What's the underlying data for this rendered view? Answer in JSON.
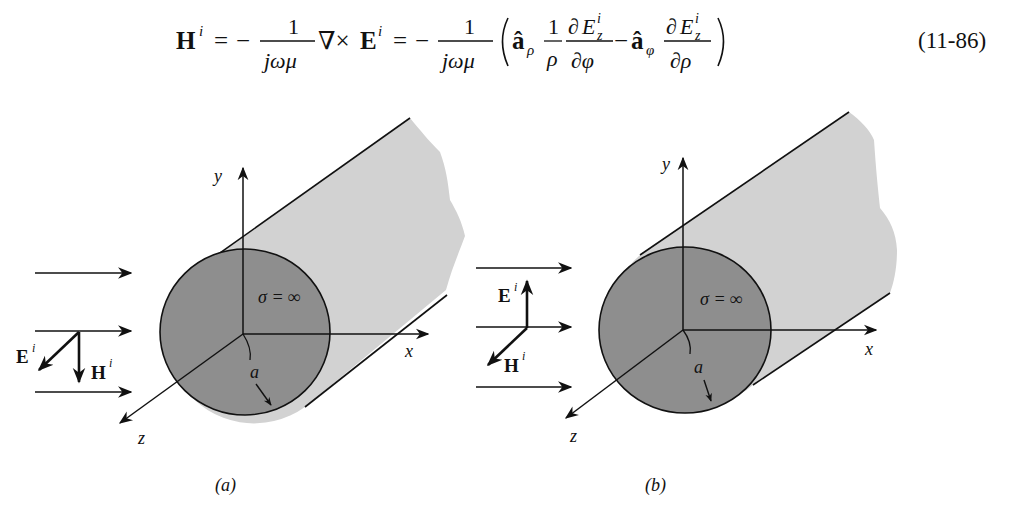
{
  "equation": {
    "lhs": "H",
    "lhs_sup": "i",
    "eq1": "=",
    "minus": "−",
    "num1": "1",
    "den1": "jωμ",
    "curl": "∇×",
    "E": "E",
    "E_sup": "i",
    "eq2": "=",
    "num2": "1",
    "den2": "jωμ",
    "a_hat": "â",
    "sub_rho": "ρ",
    "sub_phi": "φ",
    "one": "1",
    "rho": "ρ",
    "partial": "∂",
    "Ez": "E",
    "Ez_sub": "z",
    "Ez_sup": "i",
    "dphi": "∂φ",
    "drho": "∂ρ",
    "number": "(11-86)"
  },
  "figures": [
    {
      "id": "a",
      "caption": "(a)",
      "axis_labels": {
        "x": "x",
        "y": "y",
        "z": "z"
      },
      "conductivity_label": "σ = ∞",
      "radius_label": "a",
      "E_label": "E",
      "E_sup": "i",
      "H_label": "H",
      "H_sup": "i",
      "E_direction": "along z (toward viewer)",
      "H_direction": "-y (down)"
    },
    {
      "id": "b",
      "caption": "(b)",
      "axis_labels": {
        "x": "x",
        "y": "y",
        "z": "z"
      },
      "conductivity_label": "σ = ∞",
      "radius_label": "a",
      "E_label": "E",
      "E_sup": "i",
      "H_label": "H",
      "H_sup": "i",
      "E_direction": "+y (up)",
      "H_direction": "along z (toward viewer)"
    }
  ],
  "colors": {
    "ink": "#111111",
    "cylinder_body": "#d2d2d2",
    "cylinder_face": "#8e8e8e",
    "background": "#ffffff"
  }
}
